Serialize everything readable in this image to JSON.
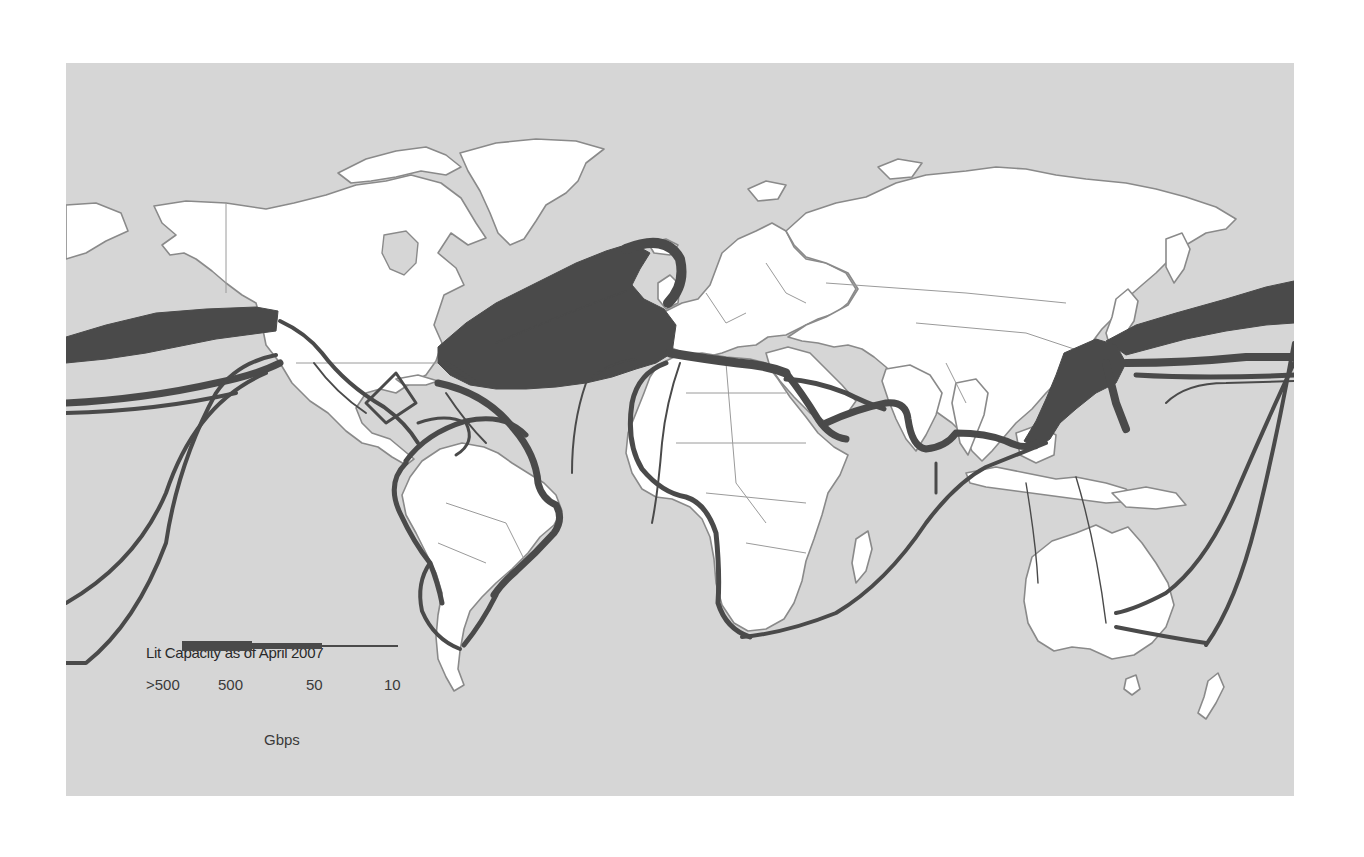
{
  "map": {
    "title": "Submarine cable lit capacity world map",
    "background_color": "#d6d6d6",
    "land_color": "#ffffff",
    "cable_color": "#4a4a4a",
    "regions": [
      "North America",
      "South America",
      "Greenland",
      "Europe",
      "Africa",
      "Asia",
      "Australia",
      "New Zealand"
    ]
  },
  "legend": {
    "title": "Lit Capacity as of April 2007",
    "ticks": [
      {
        "label": ">500"
      },
      {
        "label": "500"
      },
      {
        "label": "50"
      },
      {
        "label": "10"
      }
    ],
    "unit": "Gbps"
  },
  "routes": [
    {
      "name": "Transatlantic",
      "capacity": ">500"
    },
    {
      "name": "Transpacific North",
      "capacity": ">500"
    },
    {
      "name": "Transpacific South",
      "capacity": "500"
    },
    {
      "name": "Intra-Asia",
      "capacity": ">500"
    },
    {
      "name": "Europe-Asia via Mediterranean/Red Sea",
      "capacity": "500"
    },
    {
      "name": "Caribbean / Latin America ring",
      "capacity": "500"
    },
    {
      "name": "West Africa",
      "capacity": "50"
    },
    {
      "name": "South Africa - Asia",
      "capacity": "50"
    },
    {
      "name": "Australia - US",
      "capacity": "50"
    },
    {
      "name": "Australia - New Zealand",
      "capacity": "50"
    },
    {
      "name": "Brazil - Europe",
      "capacity": "10"
    }
  ]
}
